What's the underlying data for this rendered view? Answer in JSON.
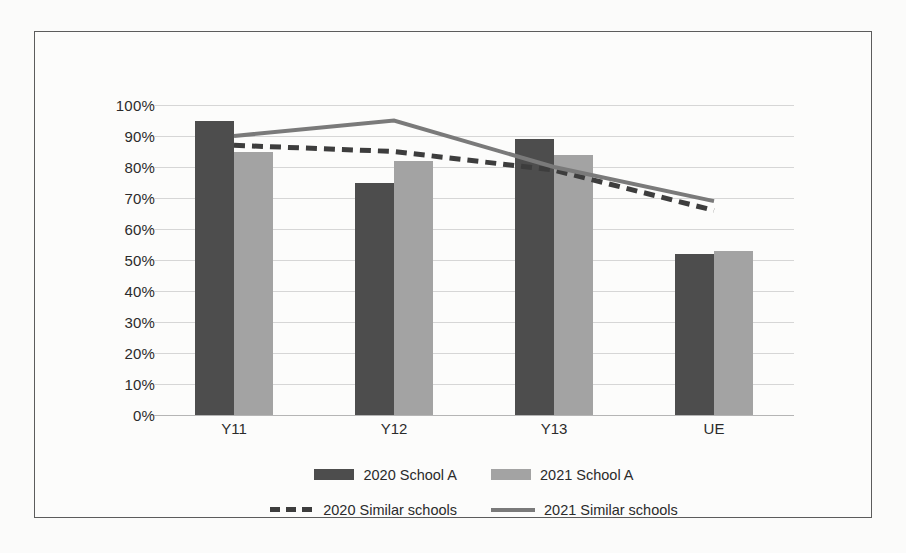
{
  "chart_data": {
    "type": "bar",
    "title": "",
    "xlabel": "",
    "ylabel": "",
    "categories": [
      "Y11",
      "Y12",
      "Y13",
      "UE"
    ],
    "ylim": [
      0,
      100
    ],
    "ytick_labels": [
      "0%",
      "10%",
      "20%",
      "30%",
      "40%",
      "50%",
      "60%",
      "70%",
      "80%",
      "90%",
      "100%"
    ],
    "ytick_values": [
      0,
      10,
      20,
      30,
      40,
      50,
      60,
      70,
      80,
      90,
      100
    ],
    "grid": true,
    "legend_position": "bottom",
    "series": [
      {
        "name": "2020 School A",
        "type": "bar",
        "color": "#4d4d4d",
        "values": [
          95,
          75,
          89,
          52
        ]
      },
      {
        "name": "2021 School A",
        "type": "bar",
        "color": "#a3a3a3",
        "values": [
          85,
          82,
          84,
          53
        ]
      },
      {
        "name": "2020 Similar schools",
        "type": "line",
        "style": "dashed",
        "color": "#3d3d3d",
        "values": [
          87,
          85,
          79,
          66
        ]
      },
      {
        "name": "2021 Similar schools",
        "type": "line",
        "style": "solid",
        "color": "#7a7a7a",
        "values": [
          90,
          95,
          80,
          69
        ]
      }
    ]
  },
  "legend": {
    "row1": [
      {
        "label": "2020 School A",
        "marker": "box-dark"
      },
      {
        "label": "2021 School A",
        "marker": "box-light"
      }
    ],
    "row2": [
      {
        "label": "2020 Similar schools",
        "marker": "line-dashed"
      },
      {
        "label": "2021 Similar schools",
        "marker": "line-solid"
      }
    ]
  },
  "colors": {
    "bar_2020": "#4d4d4d",
    "bar_2021": "#a3a3a3",
    "line_2020": "#3d3d3d",
    "line_2021": "#7a7a7a",
    "grid": "#d6d6d6",
    "frame": "#5c5c5c"
  }
}
